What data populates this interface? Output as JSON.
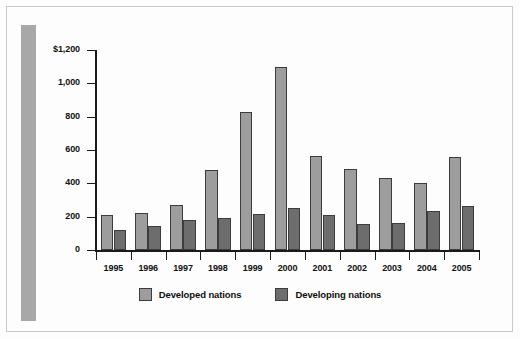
{
  "chart_data": {
    "type": "bar",
    "title": "",
    "subtitle": "",
    "xlabel": "",
    "ylabel": "",
    "ylim": [
      0,
      1200
    ],
    "yticks": [
      0,
      200,
      400,
      600,
      800,
      1000,
      1200
    ],
    "ytick_labels": [
      "0",
      "200",
      "400",
      "600",
      "800",
      "1,000",
      "$1,200"
    ],
    "grid": false,
    "legend_position": "bottom-center",
    "categories": [
      "1995",
      "1996",
      "1997",
      "1998",
      "1999",
      "2000",
      "2001",
      "2002",
      "2003",
      "2004",
      "2005"
    ],
    "series": [
      {
        "name": "Developed nations",
        "color": "#9d9d9d",
        "values": [
          210,
          220,
          270,
          480,
          830,
          1100,
          565,
          485,
          430,
          400,
          560
        ]
      },
      {
        "name": "Developing nations",
        "color": "#6d6d6d",
        "values": [
          120,
          145,
          180,
          190,
          215,
          250,
          210,
          155,
          160,
          235,
          265
        ]
      }
    ]
  },
  "legend": {
    "items": [
      {
        "label": "Developed nations",
        "color": "#9d9d9d"
      },
      {
        "label": "Developing nations",
        "color": "#6d6d6d"
      }
    ]
  },
  "decor": {
    "accent_bar_color": "#a8a8a8",
    "frame_color": "#c9c9c9",
    "axis_color": "#1a1a1a"
  }
}
